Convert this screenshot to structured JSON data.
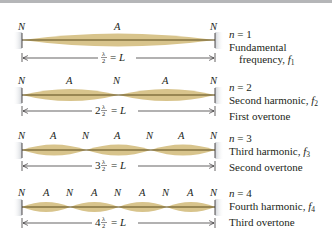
{
  "colors": {
    "string": "#5a4a1a",
    "envelope": "#d8c48c",
    "wall": "#d6d9de",
    "topbar": "#b5b6b8",
    "text": "#231f20"
  },
  "rows": [
    {
      "n_label": "n",
      "n_value": "= 1",
      "line1": "Fundamental",
      "line2_prefix": "frequency, ",
      "f_symbol": "f",
      "f_sub": "1",
      "line3": "",
      "node_label": "N",
      "antinode_label": "A",
      "dimension_coef": "",
      "dimension_frac_num": "λ",
      "dimension_frac_den": "2",
      "dimension_rhs": "= L",
      "loops": 1
    },
    {
      "n_label": "n",
      "n_value": "= 2",
      "line1_prefix": "Second harmonic, ",
      "f_symbol": "f",
      "f_sub": "2",
      "line2": "First overtone",
      "node_label": "N",
      "antinode_label": "A",
      "dimension_coef": "2",
      "dimension_frac_num": "λ",
      "dimension_frac_den": "2",
      "dimension_rhs": "= L",
      "loops": 2
    },
    {
      "n_label": "n",
      "n_value": "= 3",
      "line1_prefix": "Third harmonic, ",
      "f_symbol": "f",
      "f_sub": "3",
      "line2": "Second overtone",
      "node_label": "N",
      "antinode_label": "A",
      "dimension_coef": "3",
      "dimension_frac_num": "λ",
      "dimension_frac_den": "2",
      "dimension_rhs": "= L",
      "loops": 3
    },
    {
      "n_label": "n",
      "n_value": "= 4",
      "line1_prefix": "Fourth harmonic, ",
      "f_symbol": "f",
      "f_sub": "4",
      "line2": "Third overtone",
      "node_label": "N",
      "antinode_label": "A",
      "dimension_coef": "4",
      "dimension_frac_num": "λ",
      "dimension_frac_den": "2",
      "dimension_rhs": "= L",
      "loops": 4
    }
  ]
}
